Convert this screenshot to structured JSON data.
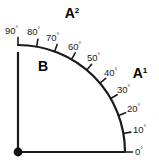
{
  "figure": {
    "type": "quarter-circle-angle-diagram",
    "title_fragment_clipped": "....... ... ..",
    "origin": {
      "x": 18,
      "y": 152
    },
    "radius": 107,
    "colors": {
      "axis": "#1a1a1a",
      "arc": "#1a1a1a",
      "tick": "#1a1a1a",
      "label_text": "#1a1a1a",
      "region_text": "#000000",
      "background": "#ffffff",
      "origin_dot": "#111111"
    }
  },
  "axes": {
    "vertical_axis_name": "vertical-axis",
    "horizontal_axis_name": "horizontal-axis",
    "origin_dot_name": "origin-dot"
  },
  "regions": [
    {
      "id": "A1",
      "base": "A",
      "sup": "1",
      "x": 140,
      "y": 78
    },
    {
      "id": "A2",
      "base": "A",
      "sup": "2",
      "x": 72,
      "y": 18
    },
    {
      "id": "B",
      "base": "B",
      "sup": "",
      "x": 43,
      "y": 71
    }
  ],
  "gradations": {
    "unit": "°",
    "step": 10,
    "min": 0,
    "max": 90,
    "ticks": [
      {
        "value": 0,
        "label": "0",
        "label_x": 135,
        "label_y": 155,
        "anchor": "start"
      },
      {
        "value": 10,
        "label": "10",
        "label_x": 133,
        "label_y": 133,
        "anchor": "start"
      },
      {
        "value": 20,
        "label": "20",
        "label_x": 127,
        "label_y": 112,
        "anchor": "start"
      },
      {
        "value": 30,
        "label": "30",
        "label_x": 117,
        "label_y": 93,
        "anchor": "start"
      },
      {
        "value": 40,
        "label": "40",
        "label_x": 104,
        "label_y": 76,
        "anchor": "start"
      },
      {
        "value": 50,
        "label": "50",
        "label_x": 87,
        "label_y": 61,
        "anchor": "start"
      },
      {
        "value": 60,
        "label": "60",
        "label_x": 68,
        "label_y": 50,
        "anchor": "start"
      },
      {
        "value": 70,
        "label": "70",
        "label_x": 46,
        "label_y": 41,
        "anchor": "start"
      },
      {
        "value": 80,
        "label": "80",
        "label_x": 27,
        "label_y": 35,
        "anchor": "start"
      },
      {
        "value": 90,
        "label": "90",
        "label_x": 5,
        "label_y": 34,
        "anchor": "start"
      }
    ]
  }
}
